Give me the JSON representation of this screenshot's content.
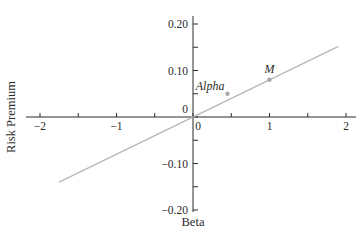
{
  "chart_data": {
    "type": "line",
    "title": "",
    "xlabel": "Beta",
    "ylabel": "Risk Premium",
    "xlim": [
      -2,
      2
    ],
    "ylim": [
      -0.2,
      0.2
    ],
    "grid": false,
    "legend": null,
    "x_ticks": [
      {
        "value": -2,
        "label": "−2"
      },
      {
        "value": -1,
        "label": "−1"
      },
      {
        "value": 0,
        "label": "0"
      },
      {
        "value": 1,
        "label": "1"
      },
      {
        "value": 2,
        "label": "2"
      }
    ],
    "y_ticks": [
      {
        "value": 0.2,
        "label": "0.20"
      },
      {
        "value": 0.1,
        "label": "0.10"
      },
      {
        "value": 0,
        "label": "0"
      },
      {
        "value": -0.1,
        "label": "−0.10"
      },
      {
        "value": -0.2,
        "label": "−0.20"
      }
    ],
    "series": [
      {
        "name": "Security Market Line",
        "x": [
          -1.75,
          1.9
        ],
        "y": [
          -0.14,
          0.152
        ],
        "slope": 0.08,
        "color": "#b8b8b8"
      }
    ],
    "points": [
      {
        "label": "Alpha",
        "x": 0.45,
        "y": 0.05,
        "color": "#a8a8a8"
      },
      {
        "label": "M",
        "x": 1.0,
        "y": 0.08,
        "color": "#a8a8a8"
      }
    ]
  },
  "colors": {
    "axis": "#2a2a2a",
    "line": "#b8b8b8",
    "point": "#a8a8a8"
  }
}
